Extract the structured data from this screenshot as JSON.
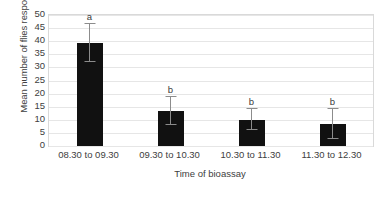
{
  "chart_data": {
    "type": "bar",
    "title": "",
    "xlabel": "Time of bioassay",
    "ylabel": "Mean number of flies responding",
    "categories": [
      "08.30 to 09.30",
      "09.30 to 10.30",
      "10.30 to 11.30",
      "11.30 to 12.30"
    ],
    "values": [
      39.5,
      13.5,
      10.0,
      8.5
    ],
    "error_low": [
      32.2,
      8.0,
      6.2,
      2.6
    ],
    "error_high": [
      47.0,
      19.0,
      14.6,
      14.5
    ],
    "annotations": [
      "a",
      "b",
      "b",
      "b"
    ],
    "ylim": [
      0,
      50
    ],
    "ytick_labels": [
      "0",
      "5",
      "10",
      "15",
      "20",
      "25",
      "30",
      "35",
      "40",
      "45",
      "50"
    ],
    "ytick_values": [
      0,
      5,
      10,
      15,
      20,
      25,
      30,
      35,
      40,
      45,
      50
    ],
    "grid": true,
    "legend": false,
    "colors": {
      "bar": "#111111",
      "error_bar": "#8c8c8c",
      "gridline": "#e6e6e6",
      "axis_border": "#d9d9d9",
      "text": "#404040",
      "background": "#ffffff"
    }
  }
}
